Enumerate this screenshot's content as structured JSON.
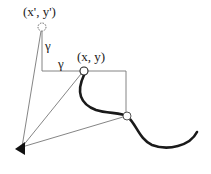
{
  "diagram": {
    "labels": {
      "prev_point": "(x', y')",
      "current_point": "(x, y)",
      "gamma_vertical": "γ",
      "gamma_horizontal": "γ"
    },
    "nodes": {
      "prev_point": {
        "x": 42,
        "y": 27,
        "style": "dashed-circle"
      },
      "current_point": {
        "x": 84,
        "y": 71,
        "style": "circle"
      },
      "curve_point": {
        "x": 127,
        "y": 116,
        "style": "circle"
      },
      "origin": {
        "x": 21,
        "y": 149,
        "style": "filled-triangle"
      }
    },
    "colors": {
      "line": "#777777",
      "curve": "#1a1a1a",
      "background": "#ffffff"
    }
  }
}
